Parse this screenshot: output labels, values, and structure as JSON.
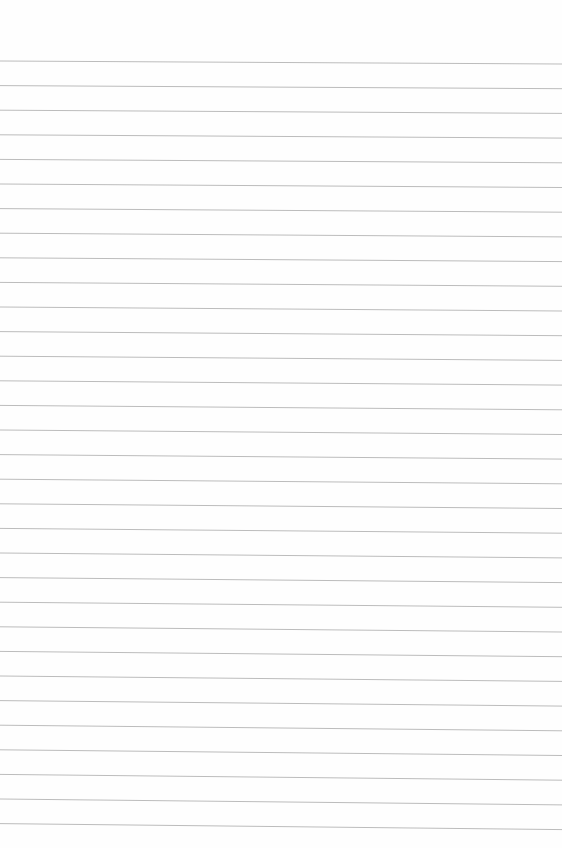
{
  "paper": {
    "type": "lined-paper",
    "background_color": "#fefefe",
    "line_color": "#bcbcbc",
    "line_count": 32,
    "first_line_left_y": 61,
    "first_line_right_y": 64,
    "line_spacing": 24.6,
    "bottom_extra_slope": 3
  }
}
